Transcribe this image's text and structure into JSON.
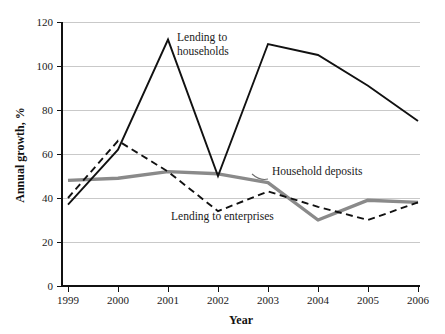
{
  "chart_data": {
    "type": "line",
    "title": "",
    "xlabel": "Year",
    "ylabel": "Annual growth, %",
    "categories": [
      "1999",
      "2000",
      "2001",
      "2002",
      "2003",
      "2004",
      "2005",
      "2006"
    ],
    "x": [
      1999,
      2000,
      2001,
      2002,
      2003,
      2004,
      2005,
      2006
    ],
    "xlim": [
      1999,
      2006
    ],
    "ylim": [
      0,
      120
    ],
    "yticks": [
      0,
      20,
      40,
      60,
      80,
      100,
      120
    ],
    "ytick_labels": [
      "0",
      "20",
      "40",
      "60",
      "80",
      "100",
      "120"
    ],
    "xtick_labels": [
      "1999",
      "2000",
      "2001",
      "2002",
      "2003",
      "2004",
      "2005",
      "2006"
    ],
    "grid": "horizontal",
    "legend": "inline-annotations",
    "series": [
      {
        "name": "Lending to households",
        "style": "solid",
        "color": "#111111",
        "values": [
          37,
          62,
          112,
          50,
          110,
          105,
          91,
          75
        ]
      },
      {
        "name": "Lending to enterprises",
        "style": "dashed",
        "color": "#111111",
        "values": [
          40,
          66,
          52,
          34,
          43,
          36,
          30,
          38
        ]
      },
      {
        "name": "Household deposits",
        "style": "thick-gray",
        "color": "#8a8a8a",
        "values": [
          48,
          49,
          52,
          51,
          47,
          30,
          39,
          38
        ]
      }
    ],
    "annotations": [
      {
        "text_line1": "Lending to",
        "text_line2": "households",
        "target_series": "Lending to households"
      },
      {
        "text_line1": "Household deposits",
        "text_line2": "",
        "target_series": "Household deposits"
      },
      {
        "text_line1": "Lending to enterprises",
        "text_line2": "",
        "target_series": "Lending to enterprises"
      }
    ]
  },
  "axes": {
    "y_title": "Annual growth, %",
    "x_title": "Year",
    "y_ticks": [
      "120",
      "100",
      "80",
      "60",
      "40",
      "20",
      "0"
    ],
    "x_ticks": [
      "1999",
      "2000",
      "2001",
      "2002",
      "2003",
      "2004",
      "2005",
      "2006"
    ]
  },
  "annotations": {
    "households_l1": "Lending to",
    "households_l2": "households",
    "deposits": "Household deposits",
    "enterprises": "Lending to enterprises"
  },
  "colors": {
    "solid_series": "#111111",
    "gray_series": "#8a8a8a",
    "gridline": "#c9c9c9",
    "background": "#ffffff"
  }
}
